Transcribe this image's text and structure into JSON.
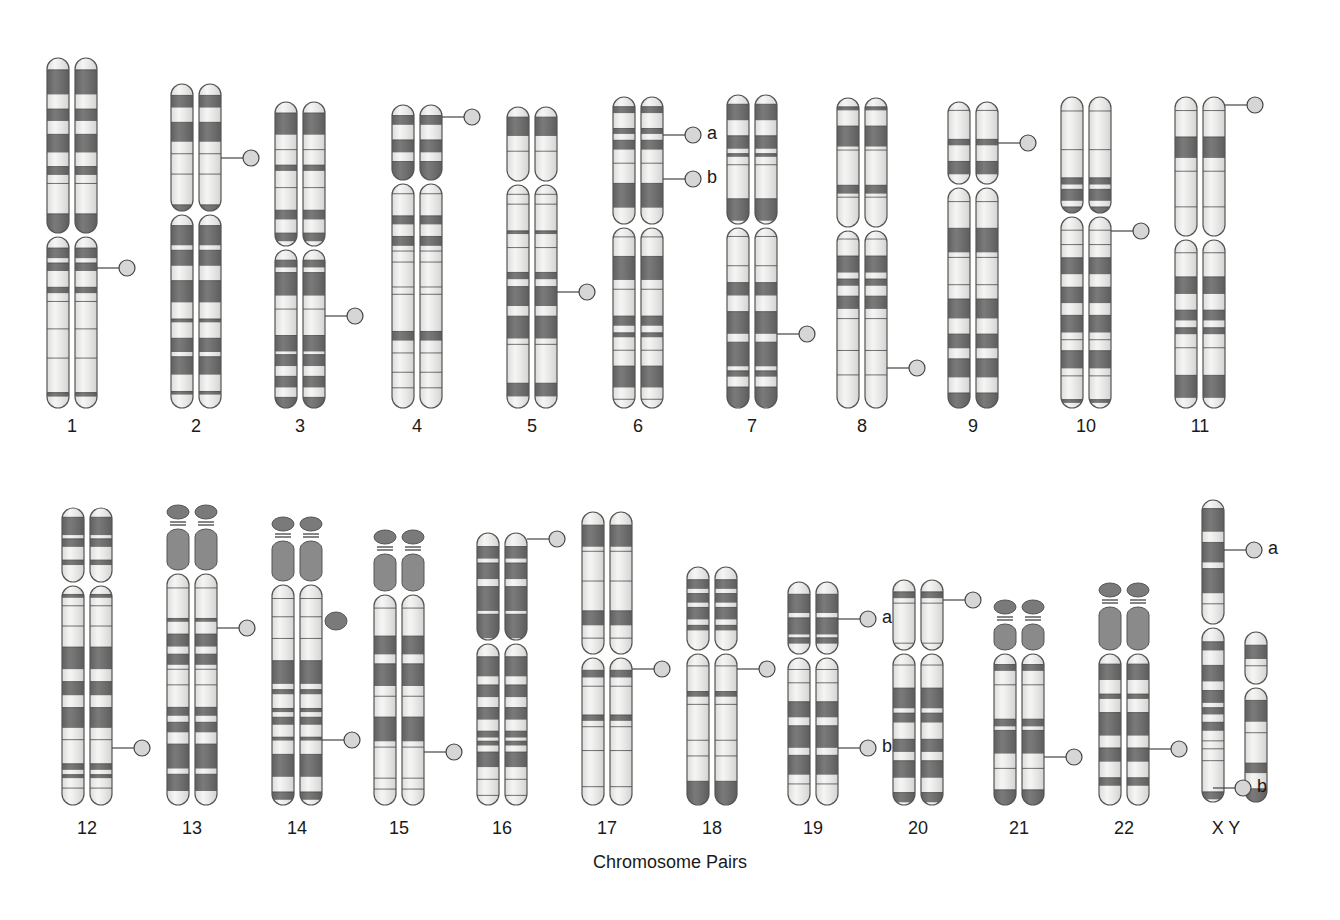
{
  "diagram": {
    "title": "Chromosome Pairs",
    "colors": {
      "dark_band": "#6b6b6b",
      "light_band": "#f4f4f2",
      "outline": "#555555",
      "marker_fill": "#d6d6d6",
      "satellite": "#7a7a7a"
    },
    "rows": [
      {
        "top": 58,
        "bottom": 408,
        "label_y": 416,
        "pairs": [
          {
            "label": "1",
            "x": 72,
            "top": 58,
            "cen": 235,
            "bottom": 408,
            "marker": {
              "y": 268,
              "side": "right"
            }
          },
          {
            "label": "2",
            "x": 196,
            "top": 84,
            "cen": 213,
            "bottom": 408,
            "marker": {
              "y": 158
            }
          },
          {
            "label": "3",
            "x": 300,
            "top": 102,
            "cen": 248,
            "bottom": 408,
            "marker": {
              "y": 316
            }
          },
          {
            "label": "4",
            "x": 417,
            "top": 105,
            "cen": 182,
            "bottom": 408,
            "marker": {
              "y": 117
            }
          },
          {
            "label": "5",
            "x": 532,
            "top": 107,
            "cen": 183,
            "bottom": 408,
            "marker": {
              "y": 292
            }
          },
          {
            "label": "6",
            "x": 638,
            "top": 97,
            "cen": 226,
            "bottom": 408,
            "markers": [
              {
                "y": 135,
                "tag": "a"
              },
              {
                "y": 179,
                "tag": "b"
              }
            ]
          },
          {
            "label": "7",
            "x": 752,
            "top": 95,
            "cen": 226,
            "bottom": 408,
            "marker": {
              "y": 334
            }
          },
          {
            "label": "8",
            "x": 862,
            "top": 98,
            "cen": 229,
            "bottom": 408,
            "marker": {
              "y": 368
            }
          },
          {
            "label": "9",
            "x": 973,
            "top": 102,
            "cen": 186,
            "bottom": 408,
            "marker": {
              "y": 143
            }
          },
          {
            "label": "10",
            "x": 1086,
            "top": 97,
            "cen": 215,
            "bottom": 408,
            "marker": {
              "y": 231
            }
          },
          {
            "label": "11",
            "x": 1200,
            "top": 97,
            "cen": 238,
            "bottom": 408,
            "marker": {
              "y": 105
            }
          }
        ]
      },
      {
        "top": 508,
        "bottom": 805,
        "label_y": 818,
        "pairs": [
          {
            "label": "12",
            "x": 87,
            "top": 508,
            "cen": 584,
            "bottom": 805,
            "marker": {
              "y": 748
            }
          },
          {
            "label": "13",
            "x": 192,
            "top": 505,
            "cen": 572,
            "bottom": 805,
            "acro": true,
            "marker": {
              "y": 628
            }
          },
          {
            "label": "14",
            "x": 297,
            "top": 517,
            "cen": 583,
            "bottom": 805,
            "acro": true,
            "extra_blob": true,
            "marker": {
              "y": 740
            }
          },
          {
            "label": "15",
            "x": 399,
            "top": 530,
            "cen": 593,
            "bottom": 805,
            "acro": true,
            "marker": {
              "y": 752
            }
          },
          {
            "label": "16",
            "x": 502,
            "top": 533,
            "cen": 642,
            "bottom": 805,
            "marker": {
              "y": 539
            }
          },
          {
            "label": "17",
            "x": 607,
            "top": 512,
            "cen": 656,
            "bottom": 805,
            "marker": {
              "y": 669
            }
          },
          {
            "label": "18",
            "x": 712,
            "top": 567,
            "cen": 652,
            "bottom": 805,
            "marker": {
              "y": 669
            }
          },
          {
            "label": "19",
            "x": 813,
            "top": 582,
            "cen": 656,
            "bottom": 805,
            "markers": [
              {
                "y": 619,
                "tag": "a"
              },
              {
                "y": 748,
                "tag": "b"
              }
            ]
          },
          {
            "label": "20",
            "x": 918,
            "top": 580,
            "cen": 652,
            "bottom": 805,
            "marker": {
              "y": 600
            }
          },
          {
            "label": "21",
            "x": 1019,
            "top": 600,
            "cen": 652,
            "bottom": 805,
            "acro": true,
            "marker": {
              "y": 757
            }
          },
          {
            "label": "22",
            "x": 1124,
            "top": 583,
            "cen": 652,
            "bottom": 805,
            "acro": true,
            "marker": {
              "y": 749
            }
          }
        ]
      }
    ],
    "sex": {
      "label": "X Y",
      "x_chrom": {
        "x": 1213,
        "top": 500,
        "cen": 626,
        "bottom": 802,
        "markers": [
          {
            "y": 550,
            "tag": "a"
          },
          {
            "y": 788,
            "tag": "b"
          }
        ]
      },
      "y_chrom": {
        "x": 1240,
        "top": 632,
        "cen": 686,
        "bottom": 802
      }
    }
  }
}
